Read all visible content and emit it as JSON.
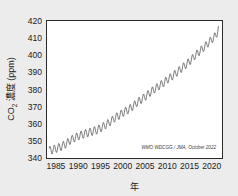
{
  "chart_data": {
    "type": "line",
    "title": "",
    "xlabel": "年",
    "ylabel": "CO₂ 濃度 (ppm)",
    "xlim": [
      1983.0,
      2022.3
    ],
    "ylim": [
      340,
      420
    ],
    "grid": true,
    "legend": null,
    "annotation": "WMO WDCGG / JMA, October 2022",
    "xticks": [
      1985,
      1990,
      1995,
      2000,
      2005,
      2010,
      2015,
      2020
    ],
    "xtick_labels": [
      "1985",
      "1990",
      "1995",
      "2000",
      "2005",
      "2010",
      "2015",
      "2020"
    ],
    "yticks": [
      340,
      350,
      360,
      370,
      380,
      390,
      400,
      410,
      420
    ],
    "ytick_labels": [
      "340",
      "350",
      "360",
      "370",
      "380",
      "390",
      "400",
      "410",
      "420"
    ],
    "series": [
      {
        "name": "Global mean CO2 concentration",
        "color": "#4d4d4d",
        "seasonal_amplitude_ppm": 2.6,
        "x": [
          1983.5,
          1984.0,
          1984.5,
          1985.0,
          1985.5,
          1986.0,
          1986.5,
          1987.0,
          1987.5,
          1988.0,
          1988.5,
          1989.0,
          1989.5,
          1990.0,
          1990.5,
          1991.0,
          1991.5,
          1992.0,
          1992.5,
          1993.0,
          1993.5,
          1994.0,
          1994.5,
          1995.0,
          1995.5,
          1996.0,
          1996.5,
          1997.0,
          1997.5,
          1998.0,
          1998.5,
          1999.0,
          1999.5,
          2000.0,
          2000.5,
          2001.0,
          2001.5,
          2002.0,
          2002.5,
          2003.0,
          2003.5,
          2004.0,
          2004.5,
          2005.0,
          2005.5,
          2006.0,
          2006.5,
          2007.0,
          2007.5,
          2008.0,
          2008.5,
          2009.0,
          2009.5,
          2010.0,
          2010.5,
          2011.0,
          2011.5,
          2012.0,
          2012.5,
          2013.0,
          2013.5,
          2014.0,
          2014.5,
          2015.0,
          2015.5,
          2016.0,
          2016.5,
          2017.0,
          2017.5,
          2018.0,
          2018.5,
          2019.0,
          2019.5,
          2020.0,
          2020.5,
          2021.0,
          2021.5
        ],
        "y": [
          344.0,
          345.0,
          344.6,
          345.9,
          345.5,
          347.0,
          346.6,
          348.4,
          348.0,
          350.5,
          350.1,
          352.0,
          351.6,
          353.2,
          352.8,
          354.2,
          353.8,
          355.0,
          354.6,
          355.8,
          355.4,
          356.6,
          356.2,
          358.0,
          357.6,
          359.6,
          359.2,
          361.4,
          361.0,
          363.6,
          363.2,
          365.2,
          364.8,
          367.0,
          366.6,
          368.4,
          368.0,
          370.4,
          370.0,
          372.6,
          372.2,
          374.4,
          374.0,
          376.4,
          376.0,
          378.6,
          378.2,
          380.6,
          380.2,
          382.4,
          382.0,
          384.2,
          383.8,
          386.4,
          386.0,
          388.2,
          387.8,
          390.4,
          390.0,
          392.6,
          392.2,
          394.8,
          394.4,
          397.2,
          396.8,
          400.0,
          399.6,
          402.4,
          402.0,
          404.8,
          404.4,
          407.4,
          407.0,
          410.0,
          409.6,
          412.6,
          415.0
        ]
      }
    ]
  },
  "axes": {
    "ylabel_parts": {
      "main": "CO",
      "sub": "2",
      "rest": " 濃度 (ppm)"
    }
  }
}
